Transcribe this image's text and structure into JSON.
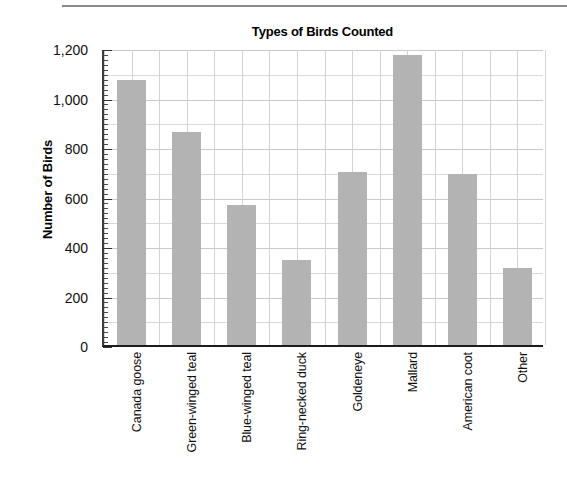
{
  "chart_data": {
    "type": "bar",
    "title": "Types of Birds Counted",
    "xlabel": "",
    "ylabel": "Number of Birds",
    "categories": [
      "Canada goose",
      "Green-winged teal",
      "Blue-winged teal",
      "Ring-necked duck",
      "Goldeneye",
      "Mallard",
      "American coot",
      "Other"
    ],
    "values": [
      1070,
      860,
      565,
      345,
      700,
      1170,
      690,
      310
    ],
    "ylim": [
      0,
      1200
    ],
    "ytick_values": [
      0,
      200,
      400,
      600,
      800,
      1000,
      1200
    ],
    "ytick_labels": [
      "0",
      "200",
      "400",
      "600",
      "800",
      "1,000",
      "1,200"
    ],
    "minor_tick_step": 20,
    "gridline_step": 100,
    "grid": "both",
    "legend": "none",
    "bar_color": "#b3b3b3",
    "axis_color": "#1c1c1c",
    "grid_color": "#d9d9dd",
    "background": "#ffffff"
  },
  "figure": {
    "title": "Types of Birds Counted",
    "y_axis_title": "Number of Birds",
    "top_rule": "horizontal-rule"
  }
}
